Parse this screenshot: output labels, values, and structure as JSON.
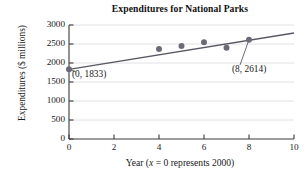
{
  "chart_data": {
    "type": "scatter",
    "title": "Expenditures for National Parks",
    "xlabel": "Year (x = 0 represents 2000)",
    "xlabel_parts": {
      "prefix": "Year (",
      "variable": "x",
      "suffix": " = 0 represents 2000)"
    },
    "ylabel": "Expenditures ($ millions)",
    "xlim": [
      0,
      10
    ],
    "ylim": [
      0,
      3000
    ],
    "xticks": [
      0,
      2,
      4,
      6,
      8,
      10
    ],
    "xtick_labels": [
      "0",
      "2",
      "4",
      "6",
      "8",
      "10"
    ],
    "yticks": [
      0,
      500,
      1000,
      1500,
      2000,
      2500,
      3000
    ],
    "ytick_labels": [
      "0",
      "500",
      "1000",
      "1500",
      "2000",
      "2500",
      "3000"
    ],
    "grid": "horizontal",
    "legend": null,
    "points": [
      {
        "x": 0,
        "y": 1833
      },
      {
        "x": 4,
        "y": 2370
      },
      {
        "x": 5,
        "y": 2445
      },
      {
        "x": 6,
        "y": 2545
      },
      {
        "x": 7,
        "y": 2400
      },
      {
        "x": 8,
        "y": 2614
      }
    ],
    "series": [
      {
        "name": "Expenditures",
        "type": "scatter",
        "marker_color": "#6b6b77",
        "values": [
          1833,
          2370,
          2445,
          2545,
          2400,
          2614
        ]
      },
      {
        "name": "Trend line",
        "type": "line",
        "line_color": "#595964",
        "endpoints": [
          {
            "x": 0,
            "y": 1833
          },
          {
            "x": 10,
            "y": 2790
          }
        ]
      }
    ],
    "annotations": [
      {
        "id": "left",
        "text": "(0, 1833)",
        "point": {
          "x": 0,
          "y": 1833
        }
      },
      {
        "id": "right",
        "text": "(8, 2614)",
        "point": {
          "x": 8,
          "y": 2614
        }
      }
    ],
    "colors": {
      "marker": "#6b6b77",
      "line": "#595964",
      "axis": "#3a3a3a",
      "grid": "#e2e2e6",
      "text": "#1a1a1a"
    }
  }
}
